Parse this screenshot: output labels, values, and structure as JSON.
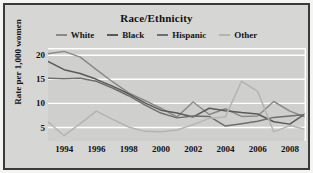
{
  "chart_data": {
    "type": "line",
    "title": "Race/Ethnicity",
    "xlabel": "",
    "ylabel": "Rate per 1,000 women",
    "x": [
      1993,
      1994,
      1995,
      1996,
      1997,
      1998,
      1999,
      2000,
      2001,
      2002,
      2003,
      2004,
      2005,
      2006,
      2007,
      2008,
      2009
    ],
    "xticks": [
      "1994",
      "1996",
      "1998",
      "2000",
      "2002",
      "2004",
      "2006",
      "2008"
    ],
    "xtick_values": [
      1994,
      1996,
      1998,
      2000,
      2002,
      2004,
      2006,
      2008
    ],
    "yticks": [
      "5",
      "10",
      "15",
      "20"
    ],
    "ytick_values": [
      5,
      10,
      15,
      20
    ],
    "ylim": [
      2.2,
      21.5
    ],
    "xlim": [
      1993,
      2009
    ],
    "grid": true,
    "grid_color": "#ffffff",
    "plot_background": "#cfcfcd",
    "legend_position": "top",
    "series": [
      {
        "name": "White",
        "color": "#8a8a88",
        "values": [
          20.3,
          20.8,
          19.6,
          17.0,
          14.5,
          12.2,
          10.6,
          9.0,
          7.2,
          10.3,
          7.7,
          8.9,
          7.3,
          7.4,
          10.4,
          8.4,
          7.1
        ]
      },
      {
        "name": "Black",
        "color": "#5a5a58",
        "values": [
          18.7,
          17.0,
          16.2,
          15.0,
          13.6,
          12.0,
          10.1,
          8.6,
          8.0,
          7.2,
          9.0,
          8.5,
          8.1,
          7.8,
          6.2,
          5.7,
          8.0
        ]
      },
      {
        "name": "Hispanic",
        "color": "#6e6e6c",
        "values": [
          15.2,
          15.1,
          15.2,
          14.6,
          13.2,
          11.6,
          9.7,
          8.0,
          7.0,
          7.4,
          7.3,
          5.3,
          5.8,
          6.3,
          7.1,
          7.4,
          7.7
        ]
      },
      {
        "name": "Other",
        "color": "#b4b4b2",
        "values": [
          6.2,
          3.3,
          5.8,
          8.4,
          6.7,
          5.1,
          4.2,
          4.1,
          4.5,
          5.6,
          6.9,
          7.2,
          14.6,
          12.5,
          4.1,
          5.4,
          4.6
        ]
      }
    ]
  }
}
